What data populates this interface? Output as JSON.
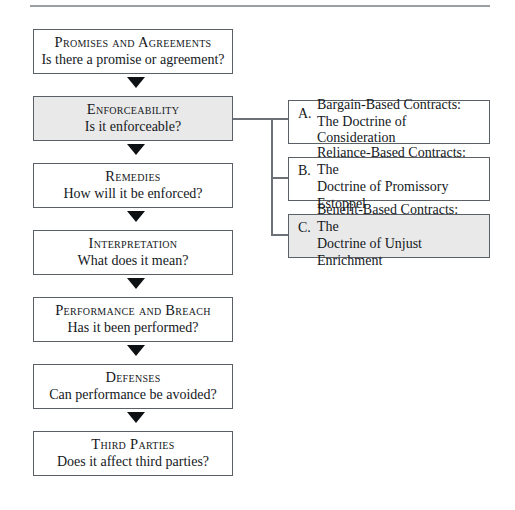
{
  "figure": {
    "name": "contract-law-analysis-flowchart",
    "has_top_rule": true,
    "colors": {
      "box_border": "#5a6066",
      "shaded_fill": "#e9e9e9",
      "plain_fill": "#ffffff",
      "connector": "#6b7177",
      "arrow": "#0d1114",
      "rule": "#9aa0a6",
      "text": "#14181c"
    }
  },
  "main_flow": [
    {
      "title": "Promises and Agreements",
      "question": "Is there a promise or agreement?",
      "shaded": false
    },
    {
      "title": "Enforceability",
      "question": "Is it enforceable?",
      "shaded": true
    },
    {
      "title": "Remedies",
      "question": "How will it be enforced?",
      "shaded": false
    },
    {
      "title": "Interpretation",
      "question": "What does it mean?",
      "shaded": false
    },
    {
      "title": "Performance and Breach",
      "question": "Has it been performed?",
      "shaded": false
    },
    {
      "title": "Defenses",
      "question": "Can performance be avoided?",
      "shaded": false
    },
    {
      "title": "Third Parties",
      "question": "Does it affect third parties?",
      "shaded": false
    }
  ],
  "branches": [
    {
      "letter": "A.",
      "line1": "Bargain-Based Contracts:",
      "line2": "The Doctrine of Consideration",
      "shaded": false
    },
    {
      "letter": "B.",
      "line1": "Reliance-Based Contracts: The",
      "line2": "Doctrine of Promissory Estoppel",
      "shaded": false
    },
    {
      "letter": "C.",
      "line1": "Benefit-Based Contracts: The",
      "line2": "Doctrine of Unjust Enrichment",
      "shaded": true
    }
  ]
}
